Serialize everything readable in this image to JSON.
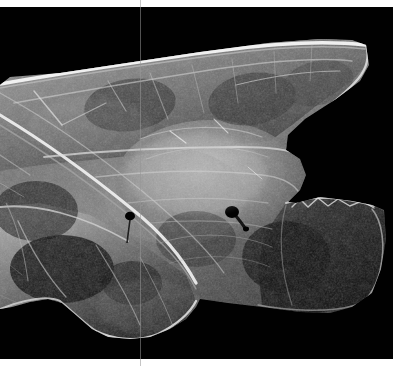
{
  "page": {
    "width": 403,
    "height": 366,
    "background_color": "#ffffff"
  },
  "photo": {
    "name": "translucent-fractured-specimen",
    "caption": "",
    "background_color": "#010101",
    "subject": "translucent fractured mineral / glass fragment",
    "plate": {
      "x": 0,
      "y": 7,
      "width": 393,
      "height": 352
    },
    "highlight_color": "#e8e8e8",
    "midtone_color": "#8d8d8d",
    "shadow_color": "#121212"
  },
  "overlay": {
    "scan_line": {
      "name": "vertical-scan-line",
      "x": 140,
      "color": "#969696",
      "width_px": 1
    }
  },
  "margins": {
    "top_px": 7,
    "right_px": 10,
    "bottom_px": 7,
    "left_px": 0,
    "color": "#ffffff"
  },
  "features": {
    "inclusions": [
      {
        "name": "dark-inclusion-left",
        "x": 130,
        "y": 216,
        "r": 5
      },
      {
        "name": "dark-inclusion-right",
        "x": 232,
        "y": 212,
        "r": 7
      }
    ]
  }
}
